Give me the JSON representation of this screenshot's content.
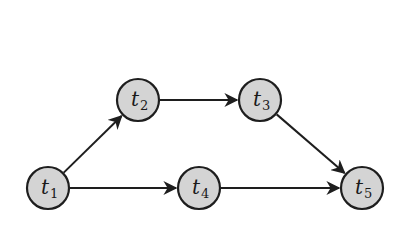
{
  "diagram": {
    "type": "directed-graph",
    "colors": {
      "node_fill": "#d4d4d4",
      "node_stroke": "#1e1e1e",
      "edge": "#1e1e1e",
      "background": "#ffffff"
    },
    "node_radius": 21,
    "nodes": [
      {
        "id": "t1",
        "base": "t",
        "sub": "1",
        "x": 48,
        "y": 188
      },
      {
        "id": "t2",
        "base": "t",
        "sub": "2",
        "x": 138,
        "y": 100
      },
      {
        "id": "t3",
        "base": "t",
        "sub": "3",
        "x": 260,
        "y": 100
      },
      {
        "id": "t4",
        "base": "t",
        "sub": "4",
        "x": 199,
        "y": 188
      },
      {
        "id": "t5",
        "base": "t",
        "sub": "5",
        "x": 362,
        "y": 188
      }
    ],
    "edges": [
      {
        "from": "t1",
        "to": "t2"
      },
      {
        "from": "t2",
        "to": "t3"
      },
      {
        "from": "t3",
        "to": "t5"
      },
      {
        "from": "t1",
        "to": "t4"
      },
      {
        "from": "t4",
        "to": "t5"
      }
    ]
  }
}
